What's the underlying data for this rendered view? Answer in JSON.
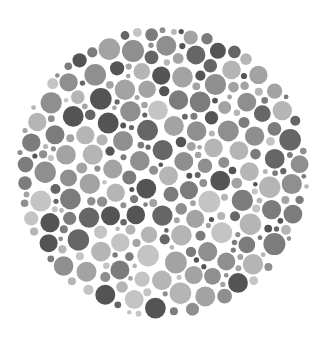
{
  "image": {
    "subject": "Ishihara-style color vision test plate (grayscale)",
    "background": "#ffffff",
    "plate": {
      "center_x": 163,
      "center_y": 172,
      "radius": 147,
      "dot_radius_range": [
        2.5,
        10
      ],
      "tones": [
        "#545454",
        "#666666",
        "#7c7c7c",
        "#8f8f8f",
        "#a3a3a3",
        "#b5b5b5",
        "#c4c4c4"
      ],
      "tone_weights": [
        0.14,
        0.14,
        0.16,
        0.16,
        0.16,
        0.14,
        0.1
      ],
      "seed": 42
    }
  }
}
